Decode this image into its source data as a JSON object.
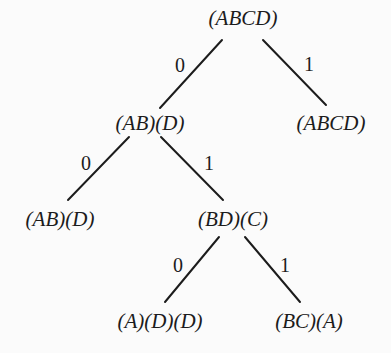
{
  "diagram": {
    "type": "binary-tree",
    "colors": {
      "background": "#fbfbfb",
      "ink": "#1c1c1c"
    },
    "nodes": [
      {
        "id": "root",
        "label": "(ABCD)",
        "x": 243,
        "y": 6
      },
      {
        "id": "n0",
        "label": "(AB)(D)",
        "x": 150,
        "y": 111
      },
      {
        "id": "n1",
        "label": "(ABCD)",
        "x": 331,
        "y": 111
      },
      {
        "id": "n00",
        "label": "(AB)(D)",
        "x": 60,
        "y": 207
      },
      {
        "id": "n01",
        "label": "(BD)(C)",
        "x": 233,
        "y": 207
      },
      {
        "id": "n010",
        "label": "(A)(D)(D)",
        "x": 160,
        "y": 309
      },
      {
        "id": "n011",
        "label": "(BC)(A)",
        "x": 309,
        "y": 309
      }
    ],
    "edges": [
      {
        "from": "root",
        "to": "n0",
        "label": "0",
        "x1": 222,
        "y1": 40,
        "x2": 160,
        "y2": 108,
        "lx": 180,
        "ly": 55
      },
      {
        "from": "root",
        "to": "n1",
        "label": "1",
        "x1": 263,
        "y1": 40,
        "x2": 326,
        "y2": 105,
        "lx": 309,
        "ly": 54
      },
      {
        "from": "n0",
        "to": "n00",
        "label": "0",
        "x1": 129,
        "y1": 137,
        "x2": 68,
        "y2": 200,
        "lx": 86,
        "ly": 153
      },
      {
        "from": "n0",
        "to": "n01",
        "label": "1",
        "x1": 161,
        "y1": 137,
        "x2": 223,
        "y2": 200,
        "lx": 209,
        "ly": 153
      },
      {
        "from": "n01",
        "to": "n010",
        "label": "0",
        "x1": 219,
        "y1": 237,
        "x2": 165,
        "y2": 302,
        "lx": 178,
        "ly": 255
      },
      {
        "from": "n01",
        "to": "n011",
        "label": "1",
        "x1": 245,
        "y1": 237,
        "x2": 300,
        "y2": 302,
        "lx": 285,
        "ly": 255
      }
    ]
  }
}
